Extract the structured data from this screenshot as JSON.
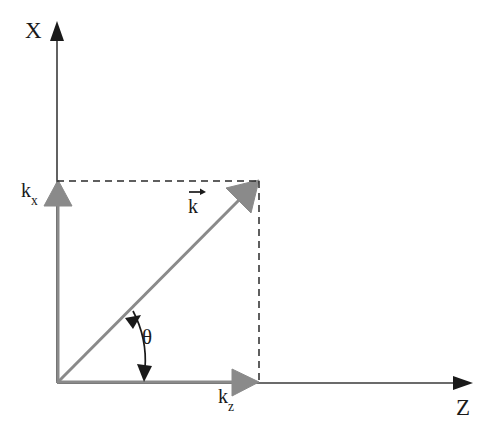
{
  "figure": {
    "background_color": "#ffffff",
    "width": 497,
    "height": 445
  },
  "axes": {
    "vertical": {
      "name": "X",
      "label": "X",
      "label_position": {
        "x": 25,
        "y": 19
      },
      "color": "#1a1a1a",
      "origin": {
        "x": 57,
        "y": 383
      },
      "tip": {
        "x": 57,
        "y": 22
      }
    },
    "horizontal": {
      "name": "Z",
      "label": "Z",
      "label_position": {
        "x": 456,
        "y": 396
      },
      "color": "#1a1a1a",
      "origin": {
        "x": 57,
        "y": 383
      },
      "tip": {
        "x": 472,
        "y": 383
      }
    }
  },
  "components": {
    "kx": {
      "label": "k",
      "subscript": "x",
      "full_label": "kx",
      "color": "#808080",
      "from": {
        "x": 57,
        "y": 383
      },
      "to": {
        "x": 57,
        "y": 181
      }
    },
    "kz": {
      "label": "k",
      "subscript": "z",
      "full_label": "kz",
      "color": "#808080",
      "from": {
        "x": 57,
        "y": 383
      },
      "to": {
        "x": 258,
        "y": 383
      }
    }
  },
  "vector": {
    "label": "k",
    "notation": "k-vector",
    "has_overarrow": true,
    "color": "#808080",
    "from": {
      "x": 57,
      "y": 383
    },
    "to": {
      "x": 258,
      "y": 181
    }
  },
  "angle": {
    "label": "θ",
    "name": "theta",
    "color": "#1a1a1a",
    "between": [
      "k-vector",
      "Z-axis"
    ],
    "value_degrees": 45
  },
  "dashed_lines": [
    {
      "name": "horizontal-projection-line",
      "from": {
        "x": 57,
        "y": 181
      },
      "to": {
        "x": 258,
        "y": 181
      },
      "color": "#1a1a1a"
    },
    {
      "name": "vertical-projection-line",
      "from": {
        "x": 258,
        "y": 181
      },
      "to": {
        "x": 258,
        "y": 383
      },
      "color": "#1a1a1a"
    }
  ],
  "colors": {
    "axis": "#1a1a1a",
    "vector_gray": "#808080",
    "dashed": "#1a1a1a",
    "text": "#1a1a1a",
    "background": "#ffffff"
  }
}
